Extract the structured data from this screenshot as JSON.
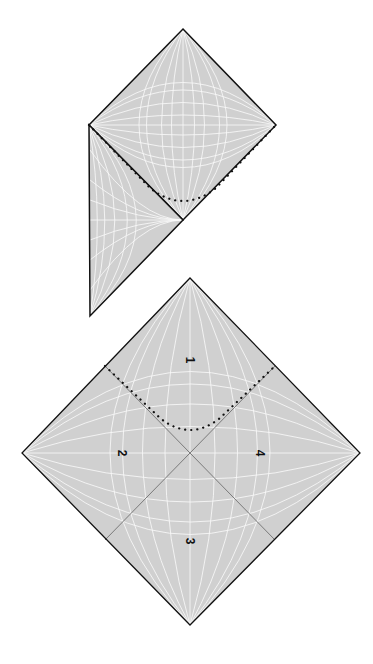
{
  "figure": {
    "colors": {
      "fill": "#d0d0d0",
      "grid": "#ffffff",
      "outline": "#111111",
      "interior_lines": "#7a7a7a",
      "dots": "#111111"
    }
  },
  "top_diagram": {
    "diamond": {
      "top": [
        183,
        29
      ],
      "right": [
        276,
        125
      ],
      "bottom": [
        183,
        220
      ],
      "left": [
        89,
        125
      ]
    },
    "triangle": {
      "top": [
        89,
        125
      ],
      "right": [
        183,
        220
      ],
      "bottom": [
        90,
        316
      ]
    },
    "dotted_curve": {
      "start": [
        89,
        125
      ],
      "min": [
        183,
        201
      ],
      "end": [
        276,
        125
      ]
    }
  },
  "bottom_diagram": {
    "diamond": {
      "top": [
        190,
        278
      ],
      "right": [
        360,
        453
      ],
      "bottom": [
        190,
        625
      ],
      "left": [
        22,
        453
      ]
    },
    "regions": [
      {
        "id": "region-1",
        "label": "1",
        "pos": [
          190,
          360
        ]
      },
      {
        "id": "region-2",
        "label": "2",
        "pos": [
          122,
          453
        ]
      },
      {
        "id": "region-3",
        "label": "3",
        "pos": [
          190,
          541
        ]
      },
      {
        "id": "region-4",
        "label": "4",
        "pos": [
          260,
          453
        ]
      }
    ],
    "dotted_curve": {
      "start": [
        105,
        366
      ],
      "min": [
        190,
        431
      ],
      "end": [
        275,
        366
      ]
    }
  }
}
